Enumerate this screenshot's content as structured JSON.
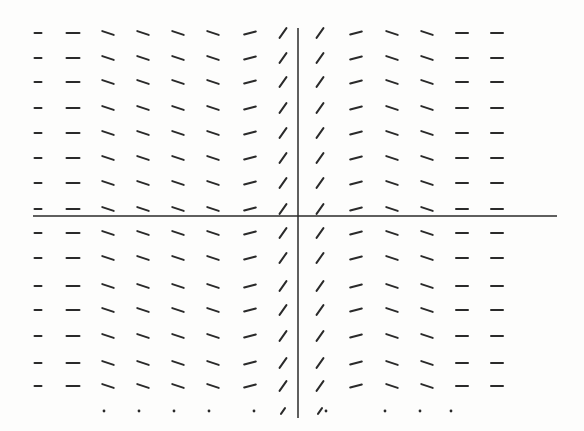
{
  "figure": {
    "title": "",
    "ink_color": "#2a2a2a",
    "background": "#fdfdfc"
  },
  "axes": {
    "x_axis": {
      "y": 216,
      "x_start": 33,
      "x_end": 557
    },
    "y_axis": {
      "x": 298,
      "y_start": 28,
      "y_end": 418
    }
  },
  "grid": {
    "columns_x": [
      38,
      73,
      108,
      143,
      178,
      213,
      250,
      283,
      320,
      356,
      392,
      427,
      462,
      497
    ],
    "rows_y": [
      33,
      58,
      82,
      108,
      133,
      158,
      183,
      209,
      233,
      258,
      286,
      310,
      336,
      363,
      386
    ],
    "column_slopes_deg": [
      0,
      0,
      -18,
      -18,
      -18,
      -18,
      15,
      55,
      55,
      15,
      -18,
      -18,
      0,
      0
    ],
    "column_lengths": [
      7,
      13,
      12,
      12,
      12,
      12,
      12,
      12,
      12,
      12,
      12,
      12,
      12,
      12
    ],
    "partial_row": {
      "y": 411,
      "dots_x": [
        104,
        139,
        174,
        209,
        254,
        326,
        385,
        420,
        451
      ],
      "segments": [
        {
          "x": 283,
          "slope_deg": 55
        },
        {
          "x": 320,
          "slope_deg": 55
        }
      ]
    }
  },
  "chart_data": {
    "type": "slope_field",
    "title": "",
    "xlabel": "",
    "ylabel": "",
    "columns": 14,
    "rows": 15,
    "slope_pattern_by_column": [
      "flat",
      "flat",
      "slight-negative",
      "slight-negative",
      "slight-negative",
      "slight-negative",
      "slight-positive",
      "steep-positive",
      "steep-positive",
      "slight-positive",
      "slight-negative",
      "slight-negative",
      "flat",
      "flat"
    ]
  }
}
